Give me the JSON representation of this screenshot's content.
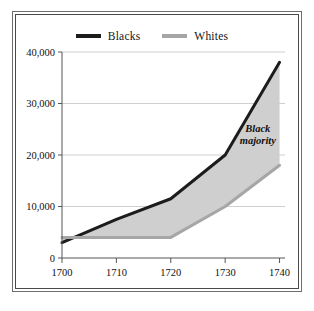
{
  "figure": {
    "background_color": "#ffffff",
    "frame": {
      "outer_color": "#6d6d6d",
      "inner_color": "#4a4a4a"
    }
  },
  "legend": {
    "position": "top-center",
    "entries": [
      {
        "label": "Blacks",
        "color": "#1c1c1c",
        "swatch": "thick-line"
      },
      {
        "label": "Whites",
        "color": "#a6a6a6",
        "swatch": "thick-line"
      }
    ]
  },
  "annotations": [
    {
      "name": "black-majority-label",
      "line1": "Black",
      "line2": "majority",
      "x": 1736,
      "y": 24500
    }
  ],
  "chart_data": {
    "type": "area",
    "title": "",
    "subtitle": "",
    "xlabel": "",
    "ylabel": "",
    "x": [
      1700,
      1710,
      1720,
      1730,
      1740
    ],
    "xlim": [
      1700,
      1741
    ],
    "ylim": [
      0,
      40000
    ],
    "xticks": [
      1700,
      1710,
      1720,
      1730,
      1740
    ],
    "xtick_labels": [
      "1700",
      "1710",
      "1720",
      "1730",
      "1740"
    ],
    "yticks": [
      0,
      10000,
      20000,
      30000,
      40000
    ],
    "ytick_labels": [
      "0",
      "10,000",
      "20,000",
      "30,000",
      "40,000"
    ],
    "grid": "horizontal",
    "legend_position": "top-center",
    "fill_between": {
      "label": "Black majority",
      "color": "#cfcfcf"
    },
    "series": [
      {
        "name": "Blacks",
        "color": "#1c1c1c",
        "line_width": 3,
        "values": [
          3000,
          7500,
          11500,
          20000,
          38000
        ]
      },
      {
        "name": "Whites",
        "color": "#a6a6a6",
        "line_width": 3,
        "values": [
          4000,
          4000,
          4000,
          10000,
          18000
        ]
      }
    ]
  }
}
